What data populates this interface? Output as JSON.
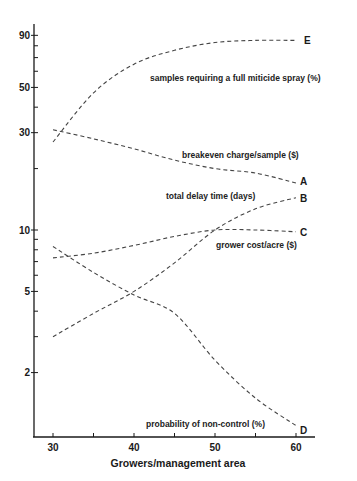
{
  "header_fragment": "",
  "chart_data": {
    "type": "line",
    "title": "",
    "xlabel": "Growers/management area",
    "ylabel": "",
    "yscale": "log",
    "xlim": [
      28,
      62
    ],
    "ylim": [
      1,
      100
    ],
    "grid": false,
    "legend_position": "inline labels",
    "x": [
      30,
      35,
      40,
      45,
      50,
      55,
      60
    ],
    "x_ticks": [
      30,
      40,
      50,
      60
    ],
    "y_ticks": [
      2,
      5,
      10,
      30,
      50,
      90
    ],
    "series": [
      {
        "id": "E",
        "name": "samples requiring a full miticide spray (%)",
        "values": [
          27,
          47,
          65,
          76,
          83,
          85,
          85
        ]
      },
      {
        "id": "A",
        "name": "breakeven charge/sample ($)",
        "values": [
          31,
          28,
          25,
          22,
          20,
          19,
          17
        ]
      },
      {
        "id": "B",
        "name": "total delay time (days)",
        "values": [
          3.0,
          3.9,
          5.0,
          6.9,
          10.0,
          12.7,
          14.4
        ]
      },
      {
        "id": "C",
        "name": "grower cost/acre ($)",
        "values": [
          7.3,
          7.7,
          8.4,
          9.3,
          10.0,
          10.0,
          9.8
        ]
      },
      {
        "id": "D",
        "name": "probability of non-control (%)",
        "values": [
          8.3,
          6.2,
          4.8,
          3.9,
          2.3,
          1.5,
          1.1
        ]
      }
    ],
    "annotations": [
      "A",
      "B",
      "C",
      "D",
      "E"
    ]
  },
  "labels": {
    "y_tick_labels": [
      "90",
      "50",
      "30",
      "10",
      "5",
      "2"
    ],
    "x_tick_labels": [
      "30",
      "40",
      "50",
      "60"
    ],
    "x_axis_title": "Growers/management area",
    "series_E": "samples requiring a full miticide spray (%)",
    "series_A": "breakeven charge/sample ($)",
    "series_B": "total delay time (days)",
    "series_C": "grower cost/acre ($)",
    "series_D": "probability of non-control (%)",
    "end_E": "E",
    "end_A": "A",
    "end_B": "B",
    "end_C": "C",
    "end_D": "D"
  }
}
